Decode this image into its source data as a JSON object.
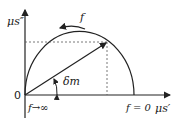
{
  "diagram": {
    "y_axis_label": "μs″",
    "x_axis_label": "μs′",
    "origin_label": "0",
    "freq_arrow_label": "f",
    "angle_label": "δm",
    "high_freq_label": "f→∞",
    "zero_freq_label": "f = 0",
    "colors": {
      "line": "#222222",
      "dash": "#555555"
    }
  }
}
